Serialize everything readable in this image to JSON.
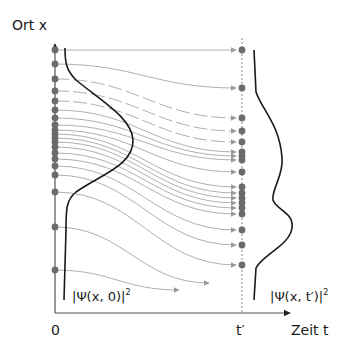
{
  "labels": {
    "y_axis": "Ort  x",
    "x_axis": "Zeit t",
    "origin": "0",
    "t_prime": "t′",
    "psi_initial_base": "|Ψ(x, 0)|",
    "psi_initial_exp": "2",
    "psi_final_base": "|Ψ(x, t′)|",
    "psi_final_exp": "2"
  },
  "colors": {
    "axis": "#555555",
    "dot": "#6b6b6b",
    "trajectory": "#b0b0b0",
    "density_curve": "#1a1a1a",
    "dashed_line": "#888888"
  },
  "geometry": {
    "x0": 55,
    "x_t": 242,
    "axis_y": 313,
    "axis_top": 44,
    "axis_right": 290
  },
  "initial_positions_y": [
    50,
    64,
    79,
    91,
    101,
    110,
    118,
    125,
    130,
    134,
    138,
    142,
    147,
    153,
    159,
    166,
    175,
    192,
    227,
    270
  ],
  "final_positions_y": [
    50,
    88,
    118,
    131,
    142,
    152,
    156,
    160,
    172,
    187,
    193,
    198,
    203,
    208,
    214,
    230,
    245,
    265
  ],
  "trajectories": [
    {
      "from": 50,
      "to": 50,
      "end_x": 242,
      "dashed": false
    },
    {
      "from": 64,
      "to": 88,
      "end_x": 242,
      "dashed": false
    },
    {
      "from": 79,
      "to": 118,
      "end_x": 242,
      "dashed": true
    },
    {
      "from": 91,
      "to": 131,
      "end_x": 242,
      "dashed": true
    },
    {
      "from": 101,
      "to": 142,
      "end_x": 242,
      "dashed": true
    },
    {
      "from": 110,
      "to": 152,
      "end_x": 242,
      "dashed": false
    },
    {
      "from": 118,
      "to": 156,
      "end_x": 242,
      "dashed": false
    },
    {
      "from": 125,
      "to": 160,
      "end_x": 242,
      "dashed": false
    },
    {
      "from": 130,
      "to": 172,
      "end_x": 242,
      "dashed": false
    },
    {
      "from": 134,
      "to": 187,
      "end_x": 242,
      "dashed": false
    },
    {
      "from": 138,
      "to": 193,
      "end_x": 242,
      "dashed": false
    },
    {
      "from": 142,
      "to": 198,
      "end_x": 242,
      "dashed": false
    },
    {
      "from": 147,
      "to": 203,
      "end_x": 242,
      "dashed": false
    },
    {
      "from": 153,
      "to": 208,
      "end_x": 242,
      "dashed": false
    },
    {
      "from": 159,
      "to": 214,
      "end_x": 242,
      "dashed": false
    },
    {
      "from": 166,
      "to": 230,
      "end_x": 242,
      "dashed": false
    },
    {
      "from": 175,
      "to": 245,
      "end_x": 242,
      "dashed": false
    },
    {
      "from": 192,
      "to": 265,
      "end_x": 242,
      "dashed": false
    },
    {
      "from": 227,
      "to": 283,
      "end_x": 215,
      "dashed": false
    },
    {
      "from": 270,
      "to": 290,
      "end_x": 185,
      "dashed": false
    }
  ],
  "initial_density_curve": "M 65 48 C 65 62, 66 70, 76 80 C 100 100, 132 118, 133 140 C 134 165, 100 175, 76 192 C 66 200, 66 210, 66 230 L 64 300",
  "final_density_curve": "M 254 50 L 256 92 C 262 110, 280 125, 282 158 C 284 175, 271 190, 273 200 C 276 210, 294 212, 292 228 C 290 245, 262 255, 256 268 L 254 300"
}
